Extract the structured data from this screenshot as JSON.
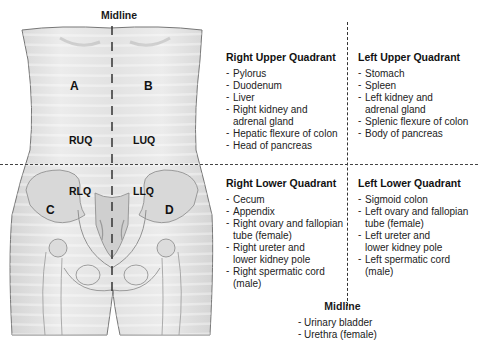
{
  "figure": {
    "midline_label": "Midline",
    "region_letters": [
      "A",
      "B",
      "C",
      "D"
    ],
    "quadrant_abbrevs": [
      "RUQ",
      "LUQ",
      "RLQ",
      "LLQ"
    ]
  },
  "quadrants": [
    {
      "title": "Right Upper Quadrant",
      "organs": [
        "Pylorus",
        "Duodenum",
        "Liver",
        "Right kidney and adrenal gland",
        "Hepatic flexure of colon",
        "Head of pancreas"
      ]
    },
    {
      "title": "Left Upper Quadrant",
      "organs": [
        "Stomach",
        "Spleen",
        "Left kidney and adrenal gland",
        "Splenic flexure of colon",
        "Body of pancreas"
      ]
    },
    {
      "title": "Right Lower Quadrant",
      "organs": [
        "Cecum",
        "Appendix",
        "Right ovary and fallopian tube (female)",
        "Right ureter and lower kidney pole",
        "Right spermatic cord (male)"
      ]
    },
    {
      "title": "Left Lower Quadrant",
      "organs": [
        "Sigmoid colon",
        "Left ovary and fallopian tube (female)",
        "Left ureter and lower kidney pole",
        "Left spermatic cord (male)"
      ]
    }
  ],
  "midline": {
    "title": "Midline",
    "organs": [
      "Urinary bladder",
      "Urethra (female)"
    ]
  },
  "colors": {
    "skin": "#e6e6e6",
    "outline": "#666666",
    "bone": "#d9d9d9",
    "dash": "#333333"
  }
}
